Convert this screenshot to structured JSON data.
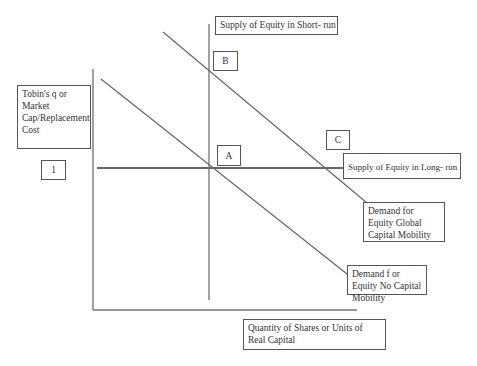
{
  "diagram": {
    "y_axis_label": "Tobin's q or Market Cap/Replacement Cost",
    "y_axis_value": "1",
    "x_axis_label": "Quantity of Shares or Units of Real Capital",
    "lines": {
      "supply_short_run": "Supply of Equity in Short- run",
      "supply_long_run": "Supply of Equity in Long- run",
      "demand_global": "Demand for Equity Global Capital Mobility",
      "demand_no_mobility": "Demand f or Equity No Capital Mobility"
    },
    "points": {
      "a": "A",
      "b": "B",
      "c": "C"
    },
    "colors": {
      "line": "#666666",
      "axis": "#777777",
      "box_border": "#555555"
    }
  }
}
